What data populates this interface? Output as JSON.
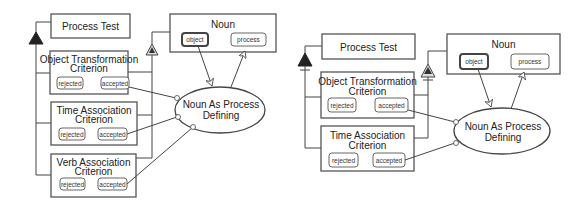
{
  "diagrams": [
    {
      "process_test": "Process Test",
      "noun": {
        "title": "Noun",
        "states": [
          "object",
          "process"
        ]
      },
      "process": [
        "Noun As Process",
        "Defining"
      ],
      "criteria": [
        {
          "title": [
            "Object Transformation",
            "Criterion"
          ],
          "states": [
            "rejected",
            "accepted"
          ]
        },
        {
          "title": [
            "Time Association",
            "Criterion"
          ],
          "states": [
            "rejected",
            "accepted"
          ]
        },
        {
          "title": [
            "Verb Association",
            "Criterion"
          ],
          "states": [
            "rejected",
            "accepted"
          ]
        }
      ]
    },
    {
      "process_test": "Process Test",
      "noun": {
        "title": "Noun",
        "states": [
          "object",
          "process"
        ]
      },
      "process": [
        "Noun As Process",
        "Defining"
      ],
      "criteria": [
        {
          "title": [
            "Object Transformation",
            "Criterion"
          ],
          "states": [
            "rejected",
            "accepted"
          ]
        },
        {
          "title": [
            "Time Association",
            "Criterion"
          ],
          "states": [
            "rejected",
            "accepted"
          ]
        }
      ]
    }
  ],
  "colors": {
    "stroke": "#444444",
    "fill": "#ffffff",
    "triangle_fill": "#222222",
    "hollow_triangle_fill": "#dddddd"
  }
}
